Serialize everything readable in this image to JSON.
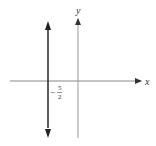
{
  "diagram": {
    "axes": {
      "x_label": "x",
      "y_label": "y"
    },
    "line": {
      "type": "vertical",
      "x_value_label": {
        "sign": "−",
        "numerator": "5",
        "denominator": "2"
      }
    },
    "colors": {
      "axis": "#888888",
      "line": "#222222",
      "text": "#333333"
    }
  }
}
